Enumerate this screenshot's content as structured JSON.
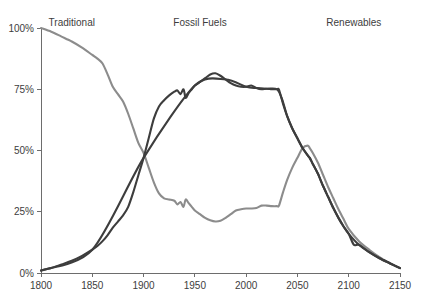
{
  "chart_data": {
    "type": "line",
    "title": "",
    "subtitle": "",
    "xlabel": "",
    "ylabel": "",
    "xlim": [
      1800,
      2150
    ],
    "ylim": [
      0,
      100
    ],
    "grid": false,
    "legend_position": "inline-above-curves",
    "x_ticks": [
      1800,
      1850,
      1900,
      1950,
      2000,
      2050,
      2100,
      2150
    ],
    "x_tick_labels": [
      "1800",
      "1850",
      "1900",
      "1950",
      "2000",
      "2050",
      "2100",
      "2150"
    ],
    "y_ticks": [
      0,
      25,
      50,
      75,
      100
    ],
    "y_tick_labels": [
      "0%",
      "25%",
      "50%",
      "75%",
      "100%"
    ],
    "annotations": [
      {
        "name": "traditional-label",
        "text": "Traditional",
        "x": 1830,
        "y": 101
      },
      {
        "name": "fossil-fuels-label",
        "text": "Fossil Fuels",
        "x": 1955,
        "y": 101
      },
      {
        "name": "renewables-label",
        "text": "Renewables",
        "x": 2105,
        "y": 101
      }
    ],
    "series": [
      {
        "name": "Traditional",
        "color": "#8c8c8c",
        "width": 2.1,
        "x": [
          1800,
          1810,
          1820,
          1830,
          1840,
          1850,
          1855,
          1860,
          1865,
          1870,
          1875,
          1880,
          1885,
          1890,
          1895,
          1900,
          1905,
          1910,
          1915,
          1920,
          1925,
          1930,
          1933,
          1936,
          1939,
          1941,
          1944,
          1947,
          1950,
          1955,
          1960,
          1965,
          1970,
          1975,
          1980,
          1985,
          1990,
          1995,
          2000,
          2005,
          2010,
          2015,
          2020,
          2025,
          2030,
          2032,
          2036,
          2040,
          2045,
          2050,
          2055,
          2060,
          2062,
          2065,
          2070,
          2075,
          2080,
          2085,
          2090,
          2095,
          2100,
          2110,
          2120,
          2130,
          2140,
          2150
        ],
        "values": [
          100,
          98.5,
          96.5,
          94.5,
          92,
          89,
          87.5,
          85.5,
          81,
          76,
          73,
          70,
          65,
          59,
          53,
          49,
          43,
          37,
          32.5,
          30.5,
          30,
          29.5,
          28,
          29,
          27,
          30,
          28.5,
          27,
          25.5,
          24,
          22.5,
          21.5,
          21,
          21.3,
          22.5,
          24,
          25.5,
          26,
          26.3,
          26.3,
          26.5,
          27.5,
          27.5,
          27.3,
          27.3,
          27.5,
          33,
          38,
          43,
          47,
          51,
          52,
          51,
          49,
          45,
          40,
          35,
          30.5,
          26,
          22,
          18,
          13,
          9.5,
          6.5,
          4,
          2
        ]
      },
      {
        "name": "Fossil Fuels",
        "color": "#3d3d3d",
        "width": 2.1,
        "x": [
          1800,
          1810,
          1820,
          1830,
          1840,
          1850,
          1855,
          1860,
          1865,
          1870,
          1875,
          1880,
          1885,
          1890,
          1895,
          1900,
          1905,
          1910,
          1915,
          1920,
          1925,
          1930,
          1933,
          1936,
          1939,
          1941,
          1944,
          1947,
          1950,
          1955,
          1960,
          1965,
          1970,
          1975,
          1980,
          1985,
          1990,
          1995,
          2000,
          2005,
          2010,
          2015,
          2020,
          2025,
          2030,
          2032,
          2036,
          2040,
          2045,
          2050,
          2055,
          2060,
          2062,
          2065,
          2070,
          2075,
          2080,
          2085,
          2090,
          2095,
          2100,
          2110,
          2120,
          2130,
          2140,
          2150
        ],
        "values": [
          1,
          2,
          3.5,
          5,
          7,
          9.5,
          11,
          13,
          15.5,
          18.5,
          21,
          23.5,
          27,
          33,
          40,
          47,
          55,
          63,
          68,
          70.5,
          72.5,
          74,
          74.5,
          73,
          75,
          71.5,
          73.5,
          75,
          76.5,
          78,
          79.5,
          81,
          81.5,
          80.5,
          79,
          77.5,
          76.5,
          76,
          76,
          76.5,
          75.5,
          75,
          75.2,
          75,
          75,
          74.8,
          69,
          64,
          59,
          55,
          51,
          48,
          47,
          44.5,
          40.5,
          35.5,
          31,
          26.5,
          22.5,
          19,
          16,
          11.5,
          8.5,
          6,
          4,
          2
        ]
      },
      {
        "name": "Renewables",
        "color": "#3d3d3d",
        "width": 2.1,
        "x": [
          1800,
          1850,
          1900,
          1950,
          1980,
          2000,
          2010,
          2020,
          2030,
          2035,
          2040,
          2045,
          2050,
          2055,
          2060,
          2062,
          2065,
          2070,
          2075,
          2080,
          2085,
          2090,
          2095,
          2100,
          2105,
          2110,
          2120,
          2130,
          2140,
          2150
        ],
        "values": [
          1,
          9.5,
          47,
          76.5,
          79,
          76,
          75.5,
          75.2,
          75,
          71,
          64,
          59,
          55,
          51,
          48,
          47,
          44.5,
          40.5,
          35.5,
          31,
          26.5,
          22.5,
          19,
          16,
          11.5,
          11.5,
          8.5,
          6,
          4,
          2
        ]
      }
    ]
  },
  "layout": {
    "plot": {
      "left": 41,
      "right": 400,
      "top": 28,
      "bottom": 273
    },
    "colors": {
      "traditional": "#8c8c8c",
      "fossil_fuels": "#3d3d3d",
      "renewables": "#3d3d3d",
      "axis": "#6d6d6d",
      "text": "#3d3d3d",
      "background": "#ffffff"
    }
  }
}
